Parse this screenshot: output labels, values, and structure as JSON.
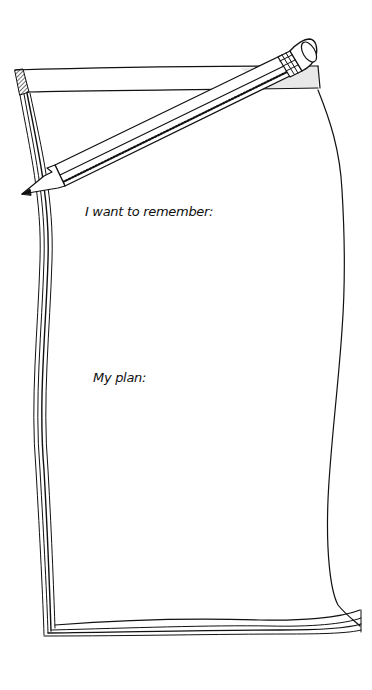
{
  "notepad": {
    "sections": [
      {
        "label": "I want to remember:",
        "value": ""
      },
      {
        "label": "My plan:",
        "value": ""
      }
    ]
  },
  "illustration": {
    "objects": [
      "notepad-icon",
      "pencil-icon"
    ],
    "ink_color": "#111111",
    "paper_color": "#ffffff",
    "binding_shade": "#e8e8e8"
  }
}
